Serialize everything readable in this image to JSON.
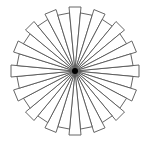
{
  "diagram": {
    "type": "radial-pinwheel",
    "center": {
      "x": 75,
      "y": 71
    },
    "spoke_count": 32,
    "radius_long": 64,
    "radius_short": 58,
    "tip_half_width": 6,
    "rotation_deg": 0,
    "stroke_color": "#555555",
    "fill_color": "#ffffff",
    "center_dot_color": "#000000",
    "center_dot_radius": 3
  }
}
